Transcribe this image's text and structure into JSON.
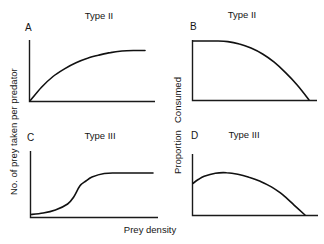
{
  "figure": {
    "ylabel_left": "No. of prey taken per predator",
    "ylabel_right_top": "Consumed",
    "ylabel_right_bottom": "Proportion",
    "xlabel": "Prey density"
  },
  "panels": [
    {
      "letter": "A",
      "title": "Type II",
      "description": "Number of prey taken rises steeply then decelerates to a plateau"
    },
    {
      "letter": "B",
      "title": "Type II",
      "description": "Proportion consumed is constant at low density then declines to zero"
    },
    {
      "letter": "C",
      "title": "Type III",
      "description": "Sigmoid rise in number of prey taken, leveling to a plateau"
    },
    {
      "letter": "D",
      "title": "Type III",
      "description": "Proportion consumed rises to a hump then declines to zero"
    }
  ],
  "chart_data": [
    {
      "type": "line",
      "panel": "A",
      "title": "Type II",
      "xlabel": "Prey density",
      "ylabel": "No. of prey taken per predator",
      "xlim": [
        0,
        1
      ],
      "ylim": [
        0,
        1
      ],
      "grid": false,
      "x": [
        0,
        0.1,
        0.2,
        0.3,
        0.4,
        0.5,
        0.6,
        0.7,
        0.8,
        0.9,
        1.0
      ],
      "y": [
        0,
        0.27,
        0.48,
        0.63,
        0.75,
        0.84,
        0.9,
        0.95,
        0.98,
        0.99,
        0.99
      ]
    },
    {
      "type": "line",
      "panel": "B",
      "title": "Type II",
      "xlabel": "Prey density",
      "ylabel": "Proportion Consumed",
      "xlim": [
        0,
        1
      ],
      "ylim": [
        0,
        1
      ],
      "grid": false,
      "x": [
        0,
        0.1,
        0.2,
        0.3,
        0.4,
        0.5,
        0.6,
        0.7,
        0.8,
        0.9,
        1.0
      ],
      "y": [
        1.0,
        1.0,
        1.0,
        0.99,
        0.95,
        0.88,
        0.78,
        0.64,
        0.46,
        0.25,
        0
      ]
    },
    {
      "type": "line",
      "panel": "C",
      "title": "Type III",
      "xlabel": "Prey density",
      "ylabel": "No. of prey taken per predator",
      "xlim": [
        0,
        1
      ],
      "ylim": [
        0,
        1
      ],
      "grid": false,
      "x": [
        0,
        0.1,
        0.2,
        0.3,
        0.35,
        0.4,
        0.45,
        0.5,
        0.6,
        0.7,
        0.8,
        0.9,
        1.0
      ],
      "y": [
        0.05,
        0.08,
        0.14,
        0.26,
        0.4,
        0.62,
        0.72,
        0.8,
        0.87,
        0.88,
        0.88,
        0.88,
        0.88
      ]
    },
    {
      "type": "line",
      "panel": "D",
      "title": "Type III",
      "xlabel": "Prey density",
      "ylabel": "Proportion Consumed",
      "xlim": [
        0,
        1
      ],
      "ylim": [
        0,
        1
      ],
      "grid": false,
      "x": [
        0,
        0.05,
        0.1,
        0.2,
        0.3,
        0.4,
        0.5,
        0.6,
        0.7,
        0.8,
        0.9,
        1.0
      ],
      "y": [
        0.62,
        0.7,
        0.76,
        0.82,
        0.83,
        0.8,
        0.74,
        0.66,
        0.55,
        0.4,
        0.2,
        0
      ]
    }
  ]
}
